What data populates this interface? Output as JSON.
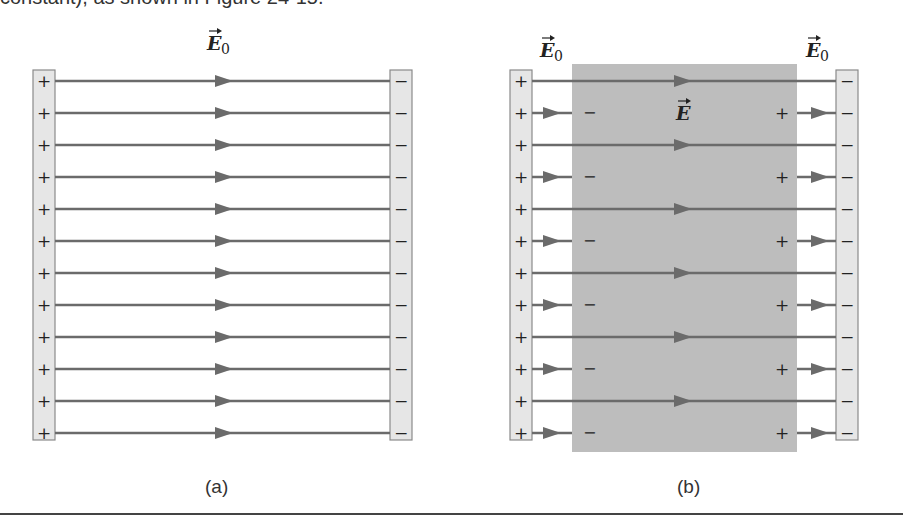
{
  "top_text": "constant), as shown in Figure 24-15.",
  "panel_a": {
    "caption": "(a)",
    "field_label": "E",
    "field_sub": "0",
    "left_plate_sign": "+",
    "right_plate_sign": "−",
    "line_count": 12
  },
  "panel_b": {
    "caption": "(b)",
    "field_label_left": "E",
    "field_label_left_sub": "0",
    "field_label_right": "E",
    "field_label_right_sub": "0",
    "field_label_inside": "E",
    "left_plate_sign": "+",
    "right_plate_sign": "−",
    "induced_left_sign": "−",
    "induced_right_sign": "+",
    "line_count": 12
  },
  "colors": {
    "plate_fill": "#e6e6e6",
    "plate_stroke": "#8a8a8a",
    "line": "#6b6b6b",
    "dielectric": "#bdbdbd",
    "text": "#222222"
  }
}
